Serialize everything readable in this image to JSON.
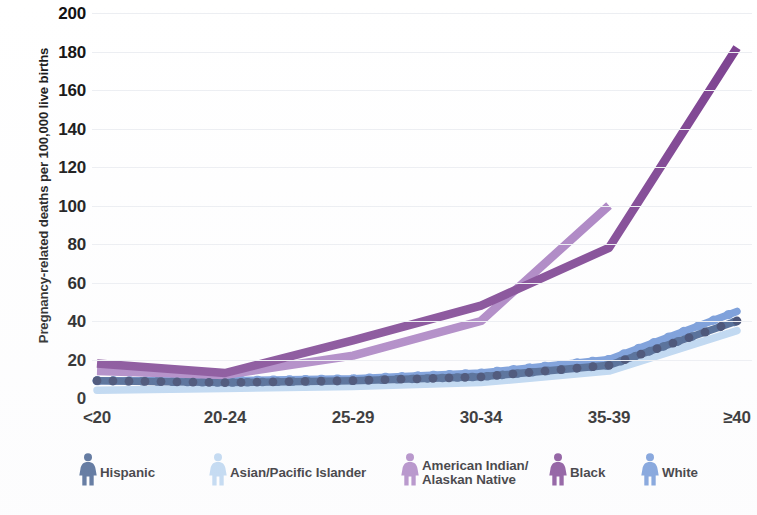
{
  "chart_data": {
    "type": "line",
    "title": "",
    "xlabel": "",
    "ylabel": "Pregnancy-related deaths per 100,000 live births",
    "categories": [
      "<20",
      "20-24",
      "25-29",
      "30-34",
      "35-39",
      "≥40"
    ],
    "ylim": [
      0,
      200
    ],
    "yticks": [
      0,
      20,
      40,
      60,
      80,
      100,
      120,
      140,
      160,
      180,
      200
    ],
    "grid": true,
    "legend_position": "bottom",
    "series": [
      {
        "name": "Hispanic",
        "color": "#3d5a8a",
        "style": "dotted",
        "values": [
          9,
          8,
          9,
          11,
          17,
          40
        ]
      },
      {
        "name": "Asian/Pacific Islander",
        "color": "#b8d4f0",
        "style": "dotted",
        "values": [
          4,
          5,
          6,
          8,
          14,
          35
        ]
      },
      {
        "name": "American Indian/\nAlaskan Native",
        "color": "#a87ec0",
        "style": "solid",
        "values": [
          14,
          12,
          22,
          40,
          100,
          null
        ]
      },
      {
        "name": "Black",
        "color": "#7b3f8f",
        "style": "solid",
        "values": [
          18,
          13,
          30,
          48,
          78,
          182
        ]
      },
      {
        "name": "White",
        "color": "#6b93d6",
        "style": "dotted",
        "values": [
          9,
          9,
          10,
          13,
          20,
          45
        ]
      }
    ]
  },
  "yaxis": {
    "title": "Pregnancy-related deaths per 100,000 live births",
    "ticks": [
      "200",
      "180",
      "160",
      "140",
      "120",
      "100",
      "80",
      "60",
      "40",
      "20",
      "0"
    ]
  },
  "xaxis": {
    "ticks": [
      "<20",
      "20-24",
      "25-29",
      "30-34",
      "35-39",
      "≥40"
    ]
  },
  "legend": {
    "items": [
      {
        "label": "Hispanic",
        "icon": "person-icon",
        "color": "#3d5a8a"
      },
      {
        "label": "Asian/Pacific Islander",
        "icon": "person-icon",
        "color": "#b8d4f0"
      },
      {
        "label": "American Indian/\nAlaskan Native",
        "icon": "person-icon",
        "color": "#a87ec0"
      },
      {
        "label": "Black",
        "icon": "person-icon",
        "color": "#7b3f8f"
      },
      {
        "label": "White",
        "icon": "person-icon",
        "color": "#6b93d6"
      }
    ]
  }
}
